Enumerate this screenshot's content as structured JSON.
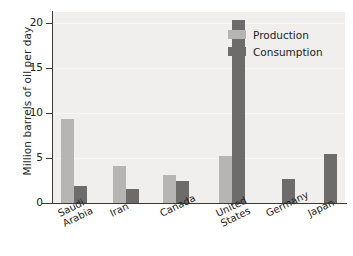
{
  "chart_data": {
    "type": "bar",
    "title": "",
    "xlabel": "",
    "ylabel": "Million barrels of oil per day",
    "categories": [
      "Saudi Arabia",
      "Iran",
      "Canada",
      "United States",
      "Germany",
      "Japan"
    ],
    "category_lines": [
      [
        "Saudi",
        "Arabia"
      ],
      [
        "Iran"
      ],
      [
        "Canada"
      ],
      [
        "United",
        "States"
      ],
      [
        "Germany"
      ],
      [
        "Japan"
      ]
    ],
    "series": [
      {
        "name": "Production",
        "color": "#b6b5b3",
        "values": [
          9.3,
          4.1,
          3.1,
          5.2,
          0.0,
          0.0
        ]
      },
      {
        "name": "Consumption",
        "color": "#6d6c6a",
        "values": [
          1.9,
          1.6,
          2.4,
          20.3,
          2.7,
          5.4
        ]
      }
    ],
    "ylim": [
      0,
      21.2
    ],
    "yticks": [
      0,
      5,
      10,
      15,
      20
    ],
    "ytick_labels": [
      "0",
      "5",
      "10",
      "15",
      "20"
    ],
    "grid": true,
    "legend_position": "top-right",
    "plot_background": "#f0efee",
    "axis_color": "#3a3a3a"
  },
  "legend": {
    "items": [
      {
        "label": "Production"
      },
      {
        "label": "Consumption"
      }
    ]
  }
}
